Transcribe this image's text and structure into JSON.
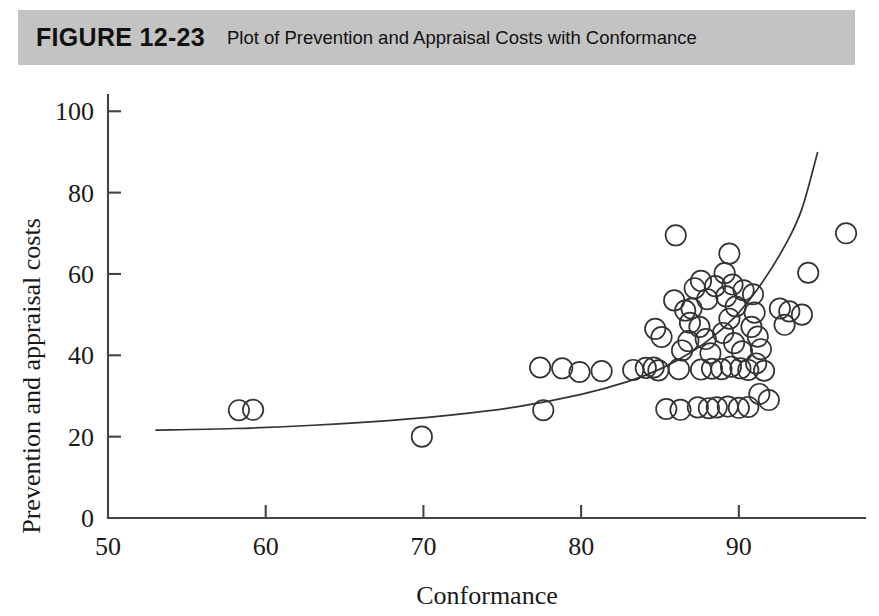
{
  "figure": {
    "number_label": "FIGURE 12-23",
    "caption": "Plot of Prevention and Appraisal Costs with Conformance",
    "bar_color": "#c3c3c3"
  },
  "chart_data": {
    "type": "scatter",
    "title": "Plot of Prevention and Appraisal Costs with Conformance",
    "xlabel": "Conformance",
    "ylabel": "Prevention and appraisal costs",
    "xlim": [
      50,
      98
    ],
    "ylim": [
      0,
      104
    ],
    "xticks": [
      50,
      60,
      70,
      80,
      90
    ],
    "yticks": [
      0,
      20,
      40,
      60,
      80,
      100
    ],
    "xtick_labels": [
      "50",
      "60",
      "70",
      "80",
      "90"
    ],
    "ytick_labels": [
      "0",
      "20",
      "40",
      "60",
      "80",
      "100"
    ],
    "grid": false,
    "legend": "none",
    "marker": "open-circle",
    "marker_color": "#333333",
    "points": [
      [
        58.3,
        26.5
      ],
      [
        59.2,
        26.6
      ],
      [
        69.9,
        20.0
      ],
      [
        77.4,
        37.0
      ],
      [
        78.8,
        36.8
      ],
      [
        79.9,
        35.9
      ],
      [
        81.3,
        36.1
      ],
      [
        77.6,
        26.5
      ],
      [
        83.3,
        36.4
      ],
      [
        84.1,
        36.9
      ],
      [
        84.6,
        37.0
      ],
      [
        84.9,
        36.3
      ],
      [
        85.1,
        44.5
      ],
      [
        84.7,
        46.5
      ],
      [
        85.4,
        26.8
      ],
      [
        86.3,
        26.6
      ],
      [
        86.0,
        69.5
      ],
      [
        86.4,
        41.2
      ],
      [
        86.8,
        43.5
      ],
      [
        86.2,
        36.6
      ],
      [
        87.2,
        56.5
      ],
      [
        87.6,
        58.3
      ],
      [
        88.0,
        53.8
      ],
      [
        87.5,
        47.0
      ],
      [
        87.9,
        44.0
      ],
      [
        88.2,
        40.5
      ],
      [
        87.6,
        36.5
      ],
      [
        88.3,
        36.7
      ],
      [
        88.9,
        36.6
      ],
      [
        87.4,
        27.2
      ],
      [
        88.1,
        27.0
      ],
      [
        88.6,
        27.2
      ],
      [
        89.4,
        65.0
      ],
      [
        89.1,
        60.2
      ],
      [
        89.6,
        57.4
      ],
      [
        89.2,
        54.5
      ],
      [
        89.8,
        52.0
      ],
      [
        89.4,
        49.0
      ],
      [
        89.0,
        45.5
      ],
      [
        89.7,
        43.0
      ],
      [
        90.2,
        41.0
      ],
      [
        89.5,
        37.2
      ],
      [
        90.1,
        36.8
      ],
      [
        90.6,
        36.4
      ],
      [
        89.3,
        27.4
      ],
      [
        90.0,
        27.1
      ],
      [
        90.6,
        27.3
      ],
      [
        90.3,
        56.0
      ],
      [
        90.9,
        55.0
      ],
      [
        91.0,
        50.5
      ],
      [
        90.8,
        47.0
      ],
      [
        91.2,
        44.6
      ],
      [
        91.4,
        41.5
      ],
      [
        91.1,
        38.0
      ],
      [
        91.6,
        36.2
      ],
      [
        91.3,
        30.5
      ],
      [
        91.9,
        29.0
      ],
      [
        92.6,
        51.5
      ],
      [
        93.2,
        50.8
      ],
      [
        92.9,
        47.5
      ],
      [
        94.4,
        60.3
      ],
      [
        94.0,
        50.0
      ],
      [
        96.8,
        70.0
      ],
      [
        85.9,
        53.5
      ],
      [
        86.6,
        51.0
      ],
      [
        88.5,
        57.0
      ],
      [
        87.0,
        51.5
      ],
      [
        86.9,
        48.0
      ]
    ],
    "fit_curve": {
      "description": "exponential trend line fitted through the scatter",
      "points": [
        [
          53.0,
          21.6
        ],
        [
          58.0,
          22.0
        ],
        [
          63.0,
          22.8
        ],
        [
          68.0,
          24.0
        ],
        [
          72.0,
          25.4
        ],
        [
          76.0,
          27.4
        ],
        [
          80.0,
          30.4
        ],
        [
          83.0,
          33.6
        ],
        [
          85.0,
          36.6
        ],
        [
          87.0,
          40.8
        ],
        [
          88.5,
          45.0
        ],
        [
          90.0,
          50.5
        ],
        [
          91.5,
          58.0
        ],
        [
          93.0,
          67.5
        ],
        [
          94.0,
          76.0
        ],
        [
          95.0,
          90.0
        ]
      ]
    }
  }
}
